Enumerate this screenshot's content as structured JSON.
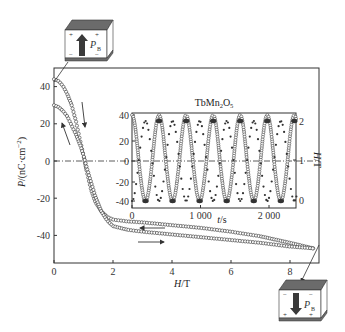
{
  "chart_data": [
    {
      "type": "scatter",
      "role": "main",
      "title": "",
      "xlabel": "H/T",
      "ylabel": "P/(nC·cm⁻²)",
      "xlim": [
        0,
        9.0
      ],
      "ylim": [
        -52,
        48
      ],
      "xticks": [
        0,
        2,
        4,
        6,
        8
      ],
      "yticks": [
        40,
        20,
        0,
        -20,
        -40
      ],
      "grid": false,
      "zero_line": "dash-dot",
      "series": [
        {
          "name": "upper branch (start P≈44, sweep back from 8.8 T)",
          "marker": "open-circle",
          "x": [
            0,
            0.15,
            0.3,
            0.45,
            0.6,
            0.75,
            0.9,
            1.0,
            1.1,
            1.25,
            1.4,
            1.6,
            1.8,
            2.0,
            2.5,
            3,
            4,
            5,
            6,
            7,
            8,
            8.8
          ],
          "y": [
            44,
            43,
            40.5,
            36,
            30,
            21,
            10,
            3,
            -5,
            -15,
            -22,
            -27,
            -30,
            -31.5,
            -32.5,
            -33,
            -34.5,
            -36,
            -38,
            -40.5,
            -44,
            -47
          ]
        },
        {
          "name": "lower branch (start P≈30, sweep up to 8.8 T)",
          "marker": "open-circle",
          "x": [
            0,
            0.15,
            0.3,
            0.45,
            0.6,
            0.75,
            0.9,
            1.0,
            1.1,
            1.25,
            1.4,
            1.6,
            1.8,
            2.0,
            2.5,
            3,
            4,
            5,
            6,
            7,
            8,
            8.8
          ],
          "y": [
            30,
            29,
            27,
            24,
            19,
            14,
            8,
            3,
            -3,
            -11,
            -19,
            -27,
            -32,
            -35,
            -37,
            -38,
            -39.5,
            -41,
            -42.5,
            -44,
            -46,
            -47
          ]
        }
      ],
      "annotations": [
        {
          "type": "arrow",
          "direction": "down",
          "near_series": 0
        },
        {
          "type": "arrow",
          "direction": "up",
          "near_series": 1
        },
        {
          "type": "arrow",
          "direction": "left",
          "near_series": 0,
          "at_x": 3
        },
        {
          "type": "arrow",
          "direction": "right",
          "near_series": 1,
          "at_x": 3
        }
      ]
    },
    {
      "type": "line",
      "role": "inset",
      "title": "TbMn₂O₅",
      "xlabel": "t/s",
      "ylabel_left": "",
      "ylabel_right": "H/T",
      "xlim": [
        0,
        2400
      ],
      "ylim_left": [
        -43,
        42
      ],
      "ylim_right": [
        0,
        2
      ],
      "xticks": [
        0,
        1000,
        2000
      ],
      "xtick_labels": [
        "0",
        "1 000",
        "2 000"
      ],
      "yticks_left": [
        40,
        20,
        0,
        -20,
        -40
      ],
      "yticks_right": [
        2,
        1,
        0
      ],
      "series": [
        {
          "name": "P (nC·cm⁻²)",
          "marker": "open-circle",
          "axis": "left",
          "amplitude": 40,
          "period_s": 395,
          "phase": "max at t=0"
        },
        {
          "name": "H (T)",
          "marker": "filled-dot",
          "axis": "right",
          "min": 0,
          "max": 2,
          "period_s": 395,
          "phase": "max when P is min"
        }
      ]
    }
  ],
  "figure": {
    "main_title": "",
    "inset_title_main": "TbMn",
    "inset_title_sub1": "2",
    "inset_title_mid": "O",
    "inset_title_sub2": "5",
    "xlabel_main_italic": "H",
    "xlabel_main_rest": "/T",
    "ylabel_main": "P/(nC·cm",
    "ylabel_main_sup": "−2",
    "ylabel_main_end": ")",
    "inset_xlabel_italic": "t",
    "inset_xlabel_rest": "/s",
    "inset_ylabel_right_italic": "H",
    "inset_ylabel_right_rest": "/T",
    "top_box": {
      "label": "P",
      "sub": "B",
      "arrow": "up",
      "plus_marks": "top",
      "minus_marks": "bottom"
    },
    "bottom_box": {
      "label": "P",
      "sub": "B",
      "arrow": "down",
      "plus_marks": "bottom",
      "minus_marks": "top"
    },
    "colors": {
      "ink": "#333333",
      "plate": "#6b6b6b",
      "box_fill": "#ffffff",
      "arrow": "#3a3a3a"
    }
  }
}
